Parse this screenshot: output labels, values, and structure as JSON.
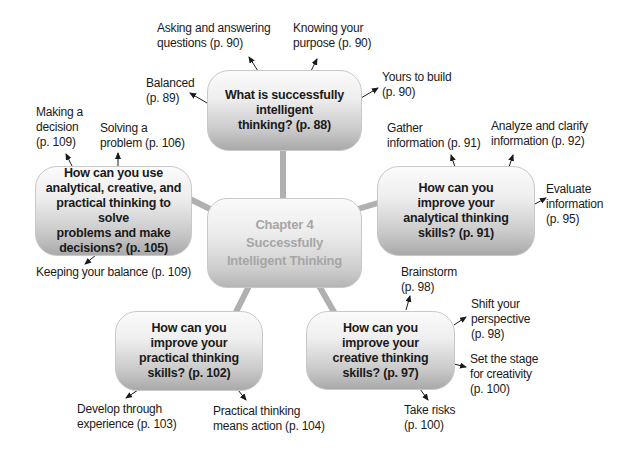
{
  "diagram": {
    "center": {
      "text": "Chapter 4\nSuccessfully\nIntelligent Thinking"
    },
    "nodes": {
      "top": {
        "text": "What is successfully\nintelligent\nthinking? (p. 88)"
      },
      "left": {
        "text": "How can you use\nanalytical, creative, and\npractical thinking to solve\nproblems and make\ndecisions? (p. 105)"
      },
      "right": {
        "text": "How can you\nimprove your\nanalytical thinking\nskills? (p. 91)"
      },
      "bottom_left": {
        "text": "How can you\nimprove your\npractical thinking\nskills? (p. 102)"
      },
      "bottom_right": {
        "text": "How can you\nimprove your\ncreative thinking\nskills? (p. 97)"
      }
    },
    "labels": {
      "asking": "Asking and answering\nquestions (p. 90)",
      "knowing": "Knowing your\npurpose (p. 90)",
      "balanced": "Balanced\n(p. 89)",
      "yours": "Yours to build\n(p. 90)",
      "making": "Making a\ndecision\n(p. 109)",
      "solving": "Solving a\nproblem (p. 106)",
      "keeping": "Keeping your balance (p. 109)",
      "gather": "Gather\ninformation (p. 91)",
      "analyze": "Analyze and clarify\ninformation (p. 92)",
      "evaluate": "Evaluate\ninformation\n(p. 95)",
      "brainstorm": "Brainstorm\n(p. 98)",
      "shift": "Shift your\nperspective\n(p. 98)",
      "stage": "Set the stage\nfor creativity\n(p. 100)",
      "risks": "Take risks\n(p. 100)",
      "develop": "Develop through\nexperience (p. 103)",
      "practical": "Practical thinking\nmeans action (p. 104)"
    },
    "colors": {
      "connector": "#b0b0b0",
      "arrow": "#1a1a1a",
      "center_text": "#a6a6a6",
      "node_text": "#1a1a1a"
    }
  }
}
